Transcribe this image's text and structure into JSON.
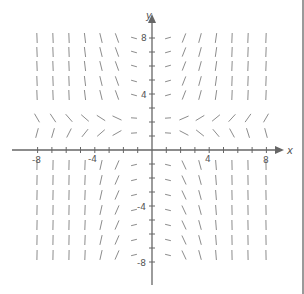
{
  "diagram": {
    "axes": {
      "x_label": "x",
      "y_label": "y",
      "x_range": [
        -8,
        8
      ],
      "y_range": [
        -8,
        8
      ],
      "x_tick_labels": [
        "-8",
        "-4",
        "4",
        "8"
      ],
      "y_tick_labels": [
        "8",
        "4",
        "-4",
        "-8"
      ],
      "axis_color": "#666666"
    },
    "segment_color": "#8c8c8c",
    "pixel_map": {
      "origin": [
        152,
        150
      ],
      "px_per_unit_x": 14.3,
      "px_per_unit_y": 14.0
    },
    "columns_px": [
      37,
      53,
      69,
      85,
      101,
      117,
      134,
      168,
      184,
      200,
      216,
      232,
      248,
      266
    ],
    "rows": [
      {
        "y_px": 38,
        "kind": "steep"
      },
      {
        "y_px": 52,
        "kind": "steep"
      },
      {
        "y_px": 66,
        "kind": "steep"
      },
      {
        "y_px": 81,
        "kind": "steep"
      },
      {
        "y_px": 95,
        "kind": "steep"
      },
      {
        "y_px": 118,
        "kind": "shallow-pos"
      },
      {
        "y_px": 133,
        "kind": "shallow-neg"
      },
      {
        "y_px": 165,
        "kind": "steep-neg"
      },
      {
        "y_px": 180,
        "kind": "steep-neg"
      },
      {
        "y_px": 195,
        "kind": "steep-neg"
      },
      {
        "y_px": 210,
        "kind": "steep-neg"
      },
      {
        "y_px": 225,
        "kind": "steep-neg"
      },
      {
        "y_px": 240,
        "kind": "steep-neg"
      },
      {
        "y_px": 255,
        "kind": "steep-neg"
      }
    ]
  }
}
